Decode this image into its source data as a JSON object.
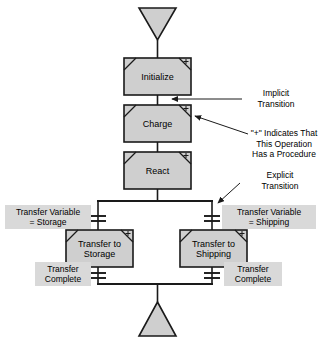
{
  "diagram": {
    "colors": {
      "step_fill": "#cfcfcf",
      "label_fill": "#d9d9d9",
      "stroke": "#1a1a1a",
      "background": "#ffffff"
    },
    "entry_terminal": {
      "name": "entry-triangle",
      "direction": "down"
    },
    "exit_terminal": {
      "name": "exit-triangle",
      "direction": "up"
    },
    "steps": [
      {
        "id": "initialize",
        "label": "Initialize",
        "has_procedure": true
      },
      {
        "id": "charge",
        "label": "Charge",
        "has_procedure": true
      },
      {
        "id": "react",
        "label": "React",
        "has_procedure": true
      },
      {
        "id": "transfer-to-storage",
        "label_line1": "Transfer to",
        "label_line2": "Storage",
        "has_procedure": true
      },
      {
        "id": "transfer-to-shipping",
        "label_line1": "Transfer to",
        "label_line2": "Shipping",
        "has_procedure": true
      }
    ],
    "transitions": [
      {
        "id": "transfer-variable-storage",
        "line1": "Transfer Variable",
        "line2": "= Storage",
        "branch": "left",
        "position": "above-step"
      },
      {
        "id": "transfer-variable-shipping",
        "line1": "Transfer Variable",
        "line2": "= Shipping",
        "branch": "right",
        "position": "above-step"
      },
      {
        "id": "transfer-complete-left",
        "line1": "Transfer",
        "line2": "Complete",
        "branch": "left",
        "position": "below-step"
      },
      {
        "id": "transfer-complete-right",
        "line1": "Transfer",
        "line2": "Complete",
        "branch": "right",
        "position": "below-step"
      }
    ],
    "annotations": [
      {
        "id": "implicit-transition",
        "line1": "Implicit",
        "line2": "Transition"
      },
      {
        "id": "plus-procedure-note",
        "line1": "\"+\" Indicates That",
        "line2": "This Operation",
        "line3": "Has a Procedure"
      },
      {
        "id": "explicit-transition",
        "line1": "Explicit",
        "line2": "Transition"
      }
    ],
    "procedure_marker": "+"
  }
}
